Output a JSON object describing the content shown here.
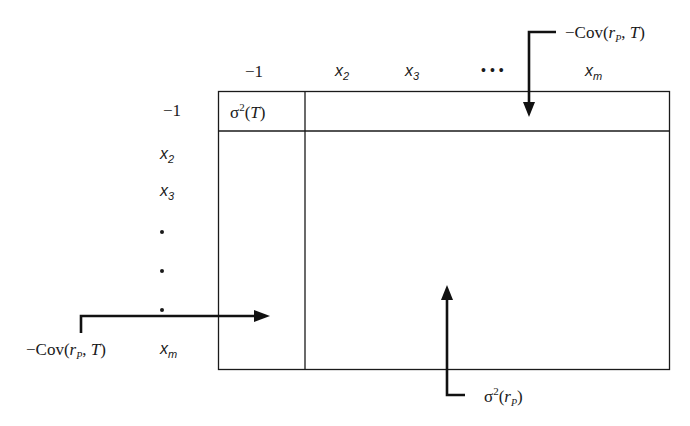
{
  "diagram": {
    "column_headers": [
      {
        "base": "",
        "text": "−1",
        "sub": ""
      },
      {
        "base": "x",
        "sub": "2"
      },
      {
        "base": "x",
        "sub": "3"
      },
      {
        "base": "•••",
        "sub": ""
      },
      {
        "base": "x",
        "sub": "m"
      }
    ],
    "row_headers": [
      {
        "text": "−1"
      },
      {
        "base": "x",
        "sub": "2"
      },
      {
        "base": "x",
        "sub": "3"
      },
      {
        "dot": true
      },
      {
        "dot": true
      },
      {
        "dot": true
      },
      {
        "base": "x",
        "sub": "m"
      }
    ],
    "cells": {
      "corner": {
        "symbol": "σ",
        "sup": "2",
        "arg": "T"
      }
    },
    "annotations": {
      "top_right": {
        "prefix": "−Cov(",
        "r": "r",
        "sub": "P",
        "suffix": ", ",
        "t": "T",
        "close": ")"
      },
      "left": {
        "prefix": "−Cov(",
        "r": "r",
        "sub": "P",
        "suffix": ", ",
        "t": "T",
        "close": ")"
      },
      "bottom": {
        "symbol": "σ",
        "sup": "2",
        "open": "(",
        "r": "r",
        "sub": "P",
        "close": ")"
      }
    },
    "colors": {
      "line": "#1a1a1a",
      "background": "#ffffff"
    }
  }
}
